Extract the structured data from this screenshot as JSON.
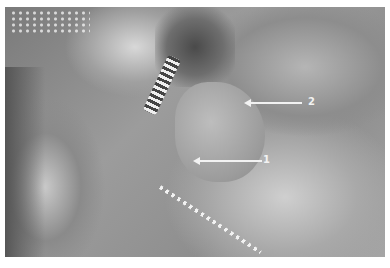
{
  "image": {
    "description": "Grayscale laparoscopic surgical photograph with two numbered arrow annotations",
    "annotations": [
      {
        "label": "1",
        "arrow_from": [
          262,
          161
        ],
        "arrow_to": [
          199,
          161
        ],
        "label_pos": [
          263,
          156
        ]
      },
      {
        "label": "2",
        "arrow_from": [
          302,
          103
        ],
        "arrow_to": [
          250,
          103
        ],
        "label_pos": [
          308,
          98
        ]
      }
    ]
  }
}
